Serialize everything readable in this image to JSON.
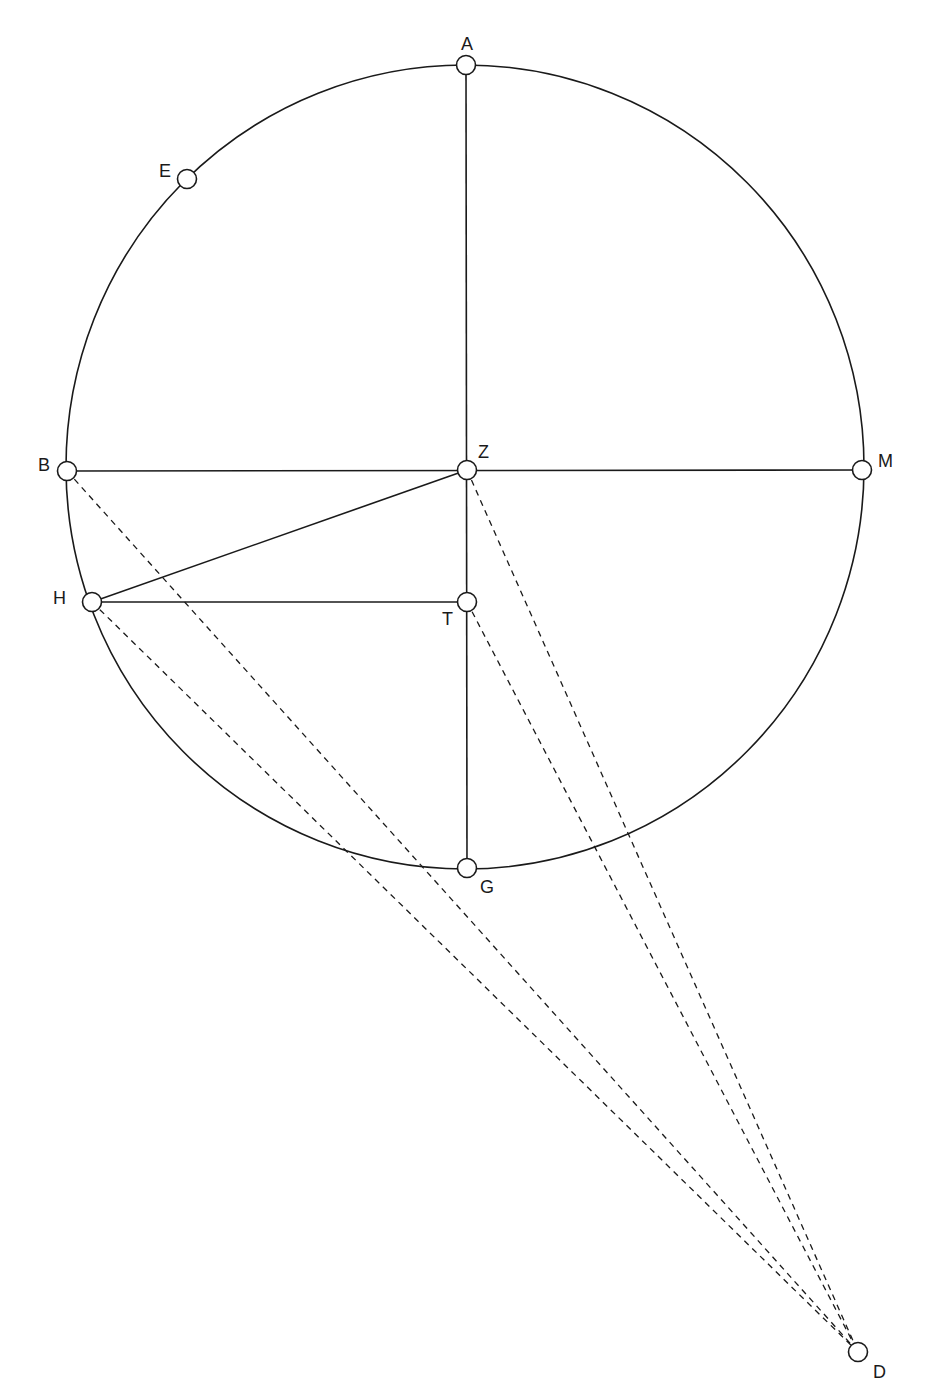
{
  "diagram": {
    "type": "geometric-construction",
    "stroke_color": "#1a1a1a",
    "background": "#ffffff",
    "circle": {
      "center": "Z",
      "cx": 465,
      "cy": 467,
      "rx": 399,
      "ry": 402
    },
    "points": [
      {
        "id": "A",
        "label": "A",
        "x": 466,
        "y": 65,
        "lx": 461,
        "ly": 50
      },
      {
        "id": "E",
        "label": "E",
        "x": 187,
        "y": 179,
        "lx": 159,
        "ly": 177
      },
      {
        "id": "B",
        "label": "B",
        "x": 67,
        "y": 471,
        "lx": 38,
        "ly": 471
      },
      {
        "id": "Z",
        "label": "Z",
        "x": 467,
        "y": 470,
        "lx": 478,
        "ly": 458
      },
      {
        "id": "M",
        "label": "M",
        "x": 862,
        "y": 470,
        "lx": 878,
        "ly": 467
      },
      {
        "id": "H",
        "label": "H",
        "x": 92,
        "y": 602,
        "lx": 53,
        "ly": 604
      },
      {
        "id": "T",
        "label": "T",
        "x": 467,
        "y": 602,
        "lx": 442,
        "ly": 625
      },
      {
        "id": "G",
        "label": "G",
        "x": 467,
        "y": 868,
        "lx": 480,
        "ly": 893
      },
      {
        "id": "D",
        "label": "D",
        "x": 858,
        "y": 1352,
        "lx": 873,
        "ly": 1378
      }
    ],
    "solid_segments": [
      {
        "from": "A",
        "to": "G"
      },
      {
        "from": "B",
        "to": "M"
      },
      {
        "from": "Z",
        "to": "H"
      },
      {
        "from": "H",
        "to": "T"
      }
    ],
    "dashed_segments": [
      {
        "from": "B",
        "to": "D"
      },
      {
        "from": "H",
        "to": "D"
      },
      {
        "from": "Z",
        "to": "D"
      },
      {
        "from": "T",
        "to": "D"
      }
    ]
  }
}
